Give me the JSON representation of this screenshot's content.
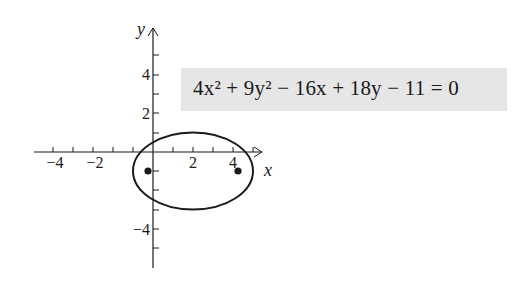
{
  "diagram": {
    "equation": "4x² + 9y² − 16x + 18y − 11 = 0",
    "axis_labels": {
      "x": "x",
      "y": "y"
    },
    "x_tick_labels": [
      "−4",
      "−2",
      "2",
      "4"
    ],
    "y_tick_labels": [
      "4",
      "2",
      "−4"
    ],
    "ellipse": {
      "center": [
        2,
        -1
      ],
      "semi_major": 3,
      "semi_minor": 2
    },
    "foci": [
      [
        -0.24,
        -1
      ],
      [
        4.24,
        -1
      ]
    ],
    "colors": {
      "stroke": "#1a1a1a",
      "equation_box": "#e6e6e6"
    }
  }
}
